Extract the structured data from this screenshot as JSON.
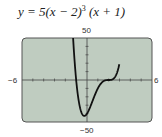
{
  "chart_data": {
    "type": "line",
    "function": "5*(x-2)^3*(x+1)",
    "xlim": [
      -6,
      6
    ],
    "ylim": [
      -50,
      50
    ],
    "x_tick_step": 1,
    "y_tick_step": 10,
    "grid": false,
    "tick_labels": {
      "xmin": "−6",
      "xmax": "6",
      "ymin": "−50",
      "ymax": "50"
    },
    "x": [
      -1.4,
      -1.2,
      -1.0,
      -0.8,
      -0.6,
      -0.4,
      -0.25,
      0,
      0.25,
      0.5,
      0.75,
      1.0,
      1.25,
      1.5,
      1.75,
      2.0,
      2.25,
      2.5,
      2.75,
      2.9
    ],
    "y": [
      60.7,
      22.6,
      0,
      -17.6,
      -30.7,
      -38.0,
      -40.1,
      -40.0,
      -37.0,
      -25.3,
      -17.1,
      -10.0,
      -4.6,
      -1.6,
      -0.3,
      0,
      0.3,
      2.2,
      7.9,
      14.2
    ],
    "background_color": "#bfccc0",
    "line_color": "#111111"
  },
  "labels": {
    "title_prefix": "y = 5(x − 2)",
    "title_exp": "3",
    "title_suffix": " (x + 1)",
    "ymax": "50",
    "ymin": "−50",
    "xmin": "−6",
    "xmax": "6"
  }
}
